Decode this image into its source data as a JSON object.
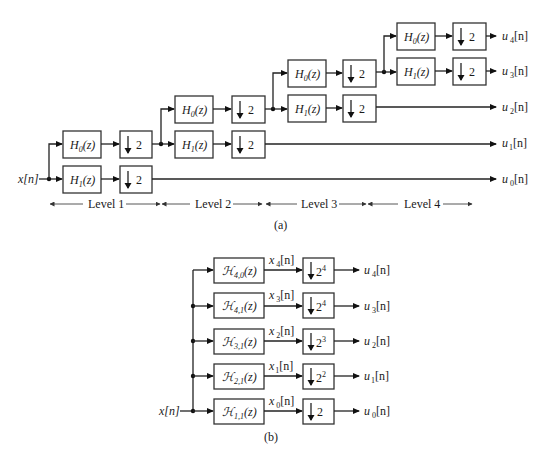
{
  "part_a": {
    "caption": "(a)",
    "input_label": "x[n]",
    "downsample_factor": "2",
    "levels": [
      {
        "label": "Level 1",
        "h0": "H",
        "h0_sub": "0",
        "h1": "H",
        "h1_sub": "1",
        "arg": "(z)"
      },
      {
        "label": "Level 2",
        "h0": "H",
        "h0_sub": "0",
        "h1": "H",
        "h1_sub": "1",
        "arg": "(z)"
      },
      {
        "label": "Level 3",
        "h0": "H",
        "h0_sub": "0",
        "h1": "H",
        "h1_sub": "1",
        "arg": "(z)"
      },
      {
        "label": "Level 4",
        "h0": "H",
        "h0_sub": "0",
        "h1": "H",
        "h1_sub": "1",
        "arg": "(z)"
      }
    ],
    "outputs": [
      {
        "name": "u",
        "sub": "4",
        "suffix": "[n]"
      },
      {
        "name": "u",
        "sub": "3",
        "suffix": "[n]"
      },
      {
        "name": "u",
        "sub": "2",
        "suffix": "[n]"
      },
      {
        "name": "u",
        "sub": "1",
        "suffix": "[n]"
      },
      {
        "name": "u",
        "sub": "0",
        "suffix": "[n]"
      }
    ]
  },
  "part_b": {
    "caption": "(b)",
    "input_label": "x[n]",
    "rows": [
      {
        "filter": "ℋ",
        "filter_sub": "4,0",
        "arg": "(z)",
        "signal": "x",
        "signal_sub": "4",
        "signal_suffix": "[n]",
        "down_base": "2",
        "down_exp": "4",
        "out": "u",
        "out_sub": "4",
        "out_suffix": "[n]"
      },
      {
        "filter": "ℋ",
        "filter_sub": "4,1",
        "arg": "(z)",
        "signal": "x",
        "signal_sub": "3",
        "signal_suffix": "[n]",
        "down_base": "2",
        "down_exp": "4",
        "out": "u",
        "out_sub": "3",
        "out_suffix": "[n]"
      },
      {
        "filter": "ℋ",
        "filter_sub": "3,1",
        "arg": "(z)",
        "signal": "x",
        "signal_sub": "2",
        "signal_suffix": "[n]",
        "down_base": "2",
        "down_exp": "3",
        "out": "u",
        "out_sub": "2",
        "out_suffix": "[n]"
      },
      {
        "filter": "ℋ",
        "filter_sub": "2,1",
        "arg": "(z)",
        "signal": "x",
        "signal_sub": "1",
        "signal_suffix": "[n]",
        "down_base": "2",
        "down_exp": "2",
        "out": "u",
        "out_sub": "1",
        "out_suffix": "[n]"
      },
      {
        "filter": "ℋ",
        "filter_sub": "1,1",
        "arg": "(z)",
        "signal": "x",
        "signal_sub": "0",
        "signal_suffix": "[n]",
        "down_base": "2",
        "down_exp": "",
        "out": "u",
        "out_sub": "0",
        "out_suffix": "[n]"
      }
    ]
  },
  "icons": {
    "downsample": "down-arrow",
    "arrowhead": "arrow-right",
    "junction": "filled-dot"
  }
}
